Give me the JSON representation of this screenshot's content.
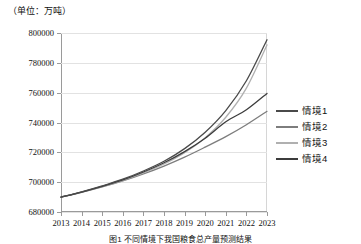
{
  "unit_label": "（单位：万吨）",
  "caption": "图1  不同情境下我国粮食总产量预测结果",
  "colors": {
    "series1": "#4a4a4a",
    "series2": "#7d7d7d",
    "series3": "#b0b0b0",
    "series4": "#3c3c3c",
    "grid": "#e2e2e2",
    "axis": "#9a9a9a",
    "plot_border": "#d6d6d6",
    "text": "#111111",
    "background": "#ffffff"
  },
  "legend": {
    "items": [
      {
        "label": "情境1",
        "color": "#4a4a4a"
      },
      {
        "label": "情境2",
        "color": "#7d7d7d"
      },
      {
        "label": "情境3",
        "color": "#b0b0b0"
      },
      {
        "label": "情境4",
        "color": "#3c3c3c"
      }
    ]
  },
  "chart_data": {
    "type": "line",
    "title": "",
    "xlabel": "",
    "ylabel": "（单位：万吨）",
    "x": [
      2013,
      2014,
      2015,
      2016,
      2017,
      2018,
      2019,
      2020,
      2021,
      2022,
      2023
    ],
    "categories": [
      "2013",
      "2014",
      "2015",
      "2016",
      "2017",
      "2018",
      "2019",
      "2020",
      "2021",
      "2022",
      "2023"
    ],
    "ylim": [
      680000,
      800000
    ],
    "yticks": [
      680000,
      700000,
      720000,
      740000,
      760000,
      780000,
      800000
    ],
    "ytick_labels": [
      "680000",
      "700000",
      "720000",
      "740000",
      "760000",
      "780000",
      "800000"
    ],
    "grid": true,
    "legend_position": "right",
    "series": [
      {
        "name": "情境1",
        "color": "#4a4a4a",
        "values": [
          690000,
          693500,
          697500,
          702000,
          707500,
          714000,
          722500,
          733500,
          748000,
          768000,
          795500
        ]
      },
      {
        "name": "情境2",
        "color": "#7d7d7d",
        "values": [
          690000,
          693200,
          696800,
          700800,
          705500,
          710800,
          716800,
          723500,
          730500,
          738500,
          747500
        ]
      },
      {
        "name": "情境3",
        "color": "#b0b0b0",
        "values": [
          690000,
          693300,
          697000,
          701200,
          706200,
          712200,
          719800,
          729800,
          743500,
          763000,
          792000
        ]
      },
      {
        "name": "情境4",
        "color": "#3c3c3c",
        "values": [
          690000,
          693400,
          697200,
          701500,
          706800,
          713000,
          720500,
          729500,
          740500,
          748500,
          759500
        ]
      }
    ]
  }
}
